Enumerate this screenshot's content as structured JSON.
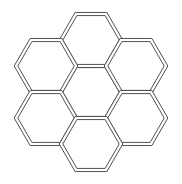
{
  "figure": {
    "width": 182,
    "height": 184,
    "background_color": "#ffffff",
    "line_color": "#3d3d3d",
    "band_fill_color": "#ffffff",
    "line_width": 0.9,
    "band_width": 3.6,
    "hexagon_count": 7,
    "orientation": "flat-top",
    "circumradius": 30,
    "cells": [
      {
        "name": "center",
        "cx": 91,
        "cy": 92,
        "r": 30
      },
      {
        "name": "top",
        "cx": 91,
        "cy": 40,
        "r": 30
      },
      {
        "name": "upper-left",
        "cx": 46,
        "cy": 66,
        "r": 30
      },
      {
        "name": "upper-right",
        "cx": 136,
        "cy": 66,
        "r": 30
      },
      {
        "name": "lower-left",
        "cx": 46,
        "cy": 118,
        "r": 30
      },
      {
        "name": "lower-right",
        "cx": 136,
        "cy": 118,
        "r": 30
      },
      {
        "name": "bottom",
        "cx": 91,
        "cy": 144,
        "r": 30
      }
    ]
  }
}
